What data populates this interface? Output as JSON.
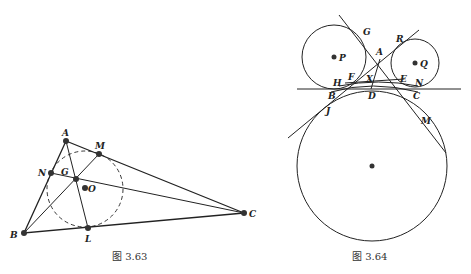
{
  "figures": [
    {
      "id": "fig-3-63",
      "caption": "图 3.63",
      "points": {
        "A": {
          "label": "A",
          "x": 66,
          "y": 141
        },
        "M": {
          "label": "M",
          "x": 99,
          "y": 154
        },
        "N": {
          "label": "N",
          "x": 51,
          "y": 173
        },
        "G": {
          "label": "G",
          "x": 76,
          "y": 179
        },
        "O": {
          "label": "O",
          "x": 85,
          "y": 189
        },
        "B": {
          "label": "B",
          "x": 24,
          "y": 233
        },
        "L": {
          "label": "L",
          "x": 88,
          "y": 228
        },
        "C": {
          "label": "C",
          "x": 244,
          "y": 213
        }
      },
      "dashed_circle": {
        "center": "O",
        "r": 38
      }
    },
    {
      "id": "fig-3-64",
      "caption": "图 3.64",
      "labels": {
        "P": "P",
        "Q": "Q",
        "G": "G",
        "A": "A",
        "R": "R",
        "F": "F",
        "X": "X",
        "E": "E",
        "N": "N",
        "H": "H",
        "B": "B",
        "D": "D",
        "C": "C",
        "J": "J",
        "M": "M"
      },
      "circles": {
        "P": {
          "cx": 334,
          "cy": 57,
          "r": 32
        },
        "Q": {
          "cx": 415,
          "cy": 63,
          "r": 24
        },
        "big": {
          "cx": 372,
          "cy": 166,
          "r": 75
        }
      }
    }
  ]
}
